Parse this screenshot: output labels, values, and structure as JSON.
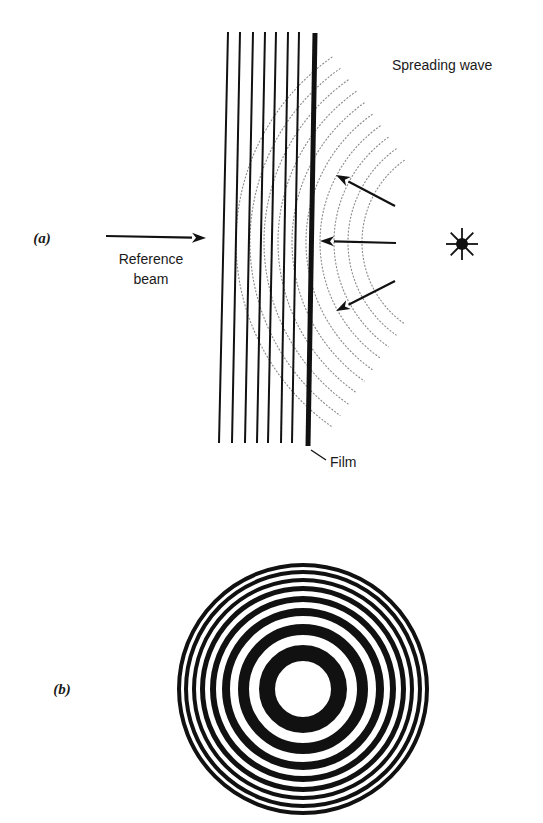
{
  "figure": {
    "width": 543,
    "height": 823,
    "colors": {
      "ink": "#111111",
      "wave": "#8a8a8a",
      "background": "#ffffff"
    }
  },
  "panel_a": {
    "label": "(a)",
    "label_pos": [
      42,
      243
    ],
    "reference_beam": {
      "label_line1": "Reference",
      "label_line2": "beam",
      "label_pos1": [
        151,
        264
      ],
      "label_pos2": [
        151,
        284
      ],
      "arrow": {
        "x1": 106,
        "y1": 236,
        "x2": 206,
        "y2": 238
      }
    },
    "reference_lines": {
      "top": [
        [
          228,
          32
        ],
        [
          240,
          32
        ],
        [
          253,
          32
        ],
        [
          265,
          32
        ],
        [
          276,
          32
        ],
        [
          288,
          32
        ],
        [
          299,
          32
        ]
      ],
      "bottom": [
        [
          219,
          443
        ],
        [
          232,
          443
        ],
        [
          245,
          443
        ],
        [
          257,
          443
        ],
        [
          268,
          443
        ],
        [
          281,
          443
        ],
        [
          292,
          443
        ]
      ]
    },
    "film": {
      "label": "Film",
      "top": [
        315,
        33
      ],
      "bottom": [
        308,
        446
      ],
      "leader": {
        "x1": 311,
        "y1": 450,
        "x2": 326,
        "y2": 460
      },
      "label_pos": [
        330,
        467
      ]
    },
    "spreading_wave": {
      "label": "Spreading wave",
      "label_pos": [
        392,
        70
      ],
      "center": [
        462,
        242
      ],
      "radii": [
        100,
        114,
        128,
        142,
        156,
        170,
        184,
        198,
        212,
        226
      ],
      "angle_span_deg": 55
    },
    "wave_arrows": [
      {
        "x1": 395,
        "y1": 206,
        "x2": 336,
        "y2": 175
      },
      {
        "x1": 396,
        "y1": 243,
        "x2": 320,
        "y2": 241
      },
      {
        "x1": 395,
        "y1": 281,
        "x2": 336,
        "y2": 311
      }
    ],
    "point_source": {
      "center": [
        462,
        244
      ],
      "dot_radius": 6,
      "ray_length": 16
    }
  },
  "panel_b": {
    "label": "(b)",
    "label_pos": [
      62,
      694
    ],
    "rings": {
      "center": [
        303,
        689
      ],
      "dark_bands": [
        {
          "r_inner": 28,
          "r_outer": 44
        },
        {
          "r_inner": 54,
          "r_outer": 65
        },
        {
          "r_inner": 73,
          "r_outer": 81
        },
        {
          "r_inner": 87,
          "r_outer": 93
        },
        {
          "r_inner": 98,
          "r_outer": 103
        },
        {
          "r_inner": 107,
          "r_outer": 111
        },
        {
          "r_inner": 115,
          "r_outer": 119
        },
        {
          "r_inner": 122,
          "r_outer": 126
        }
      ]
    }
  }
}
